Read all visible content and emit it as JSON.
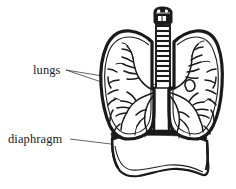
{
  "figure": {
    "background_color": "#ffffff",
    "ink_color": "#1a1a1a",
    "leader_line_color": "#3a3a46",
    "width": 236,
    "height": 189,
    "labels": [
      {
        "id": "lungs",
        "text": "lungs",
        "x": 33,
        "y": 64,
        "leader_count": 2,
        "points_to": [
          "left-lung",
          "right-lung"
        ]
      },
      {
        "id": "diaphragm",
        "text": "diaphragm",
        "x": 8,
        "y": 133,
        "leader_count": 1,
        "points_to": [
          "diaphragm-dome"
        ]
      }
    ],
    "parts": [
      {
        "id": "larynx",
        "name": "larynx"
      },
      {
        "id": "trachea",
        "name": "trachea"
      },
      {
        "id": "left-lung",
        "name": "left lung"
      },
      {
        "id": "right-lung",
        "name": "right lung"
      },
      {
        "id": "bronchial-tree",
        "name": "bronchial tree"
      },
      {
        "id": "diaphragm-dome",
        "name": "diaphragm"
      }
    ]
  }
}
